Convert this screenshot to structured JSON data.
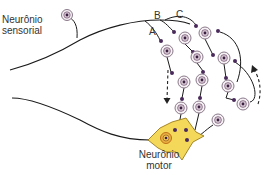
{
  "diagram": {
    "labels": {
      "sensory_neuron_line1": "Neurônio",
      "sensory_neuron_line2": "sensorial",
      "motor_neuron_line1": "Neurônio",
      "motor_neuron_line2": "motor",
      "branch_a": "A",
      "branch_b": "B",
      "branch_c": "C"
    },
    "colors": {
      "line": "#1a1a1a",
      "synapse": "#4a2a5a",
      "interneuron_ring": "#8a7a8a",
      "interneuron_fill": "#f6f1f4",
      "interneuron_nucleus": "#3a2040",
      "motor_body": "#f3d85a",
      "motor_outline": "#9a7a1a",
      "motor_nucleus_ring": "#c0701a",
      "arrow": "#222222"
    },
    "interneurons": [
      {
        "x": 167,
        "y": 51
      },
      {
        "x": 185,
        "y": 38
      },
      {
        "x": 205,
        "y": 33
      },
      {
        "x": 197,
        "y": 57
      },
      {
        "x": 224,
        "y": 58
      },
      {
        "x": 184,
        "y": 82
      },
      {
        "x": 202,
        "y": 80
      },
      {
        "x": 228,
        "y": 86
      },
      {
        "x": 181,
        "y": 108
      },
      {
        "x": 199,
        "y": 107
      },
      {
        "x": 227,
        "y": 109
      },
      {
        "x": 243,
        "y": 104
      },
      {
        "x": 218,
        "y": 122
      }
    ]
  }
}
